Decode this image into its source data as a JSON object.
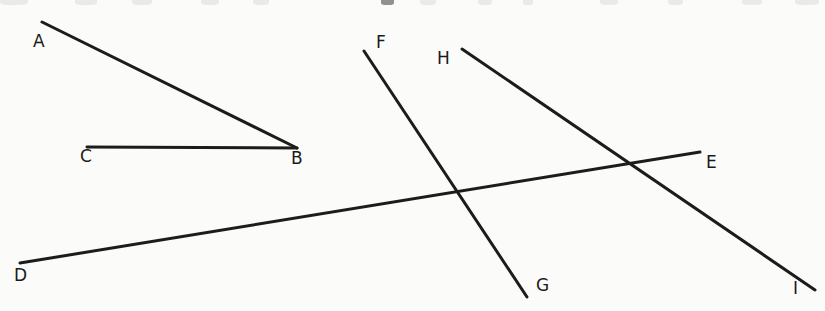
{
  "figure": {
    "width": 825,
    "height": 311,
    "background_color": "#fbfbf9",
    "stroke_color": "#1c1c1c",
    "stroke_width": 3,
    "label_color": "#1a1a1a",
    "label_font_size": 17
  },
  "points": {
    "A": {
      "x": 42,
      "y": 22,
      "label": "A",
      "label_x": 33,
      "label_y": 33
    },
    "B": {
      "x": 297,
      "y": 148,
      "label": "B",
      "label_x": 291,
      "label_y": 150
    },
    "C": {
      "x": 87,
      "y": 147,
      "label": "C",
      "label_x": 80,
      "label_y": 148
    },
    "D": {
      "x": 20,
      "y": 263,
      "label": "D",
      "label_x": 14,
      "label_y": 267
    },
    "E": {
      "x": 700,
      "y": 152,
      "label": "E",
      "label_x": 706,
      "label_y": 154
    },
    "F": {
      "x": 364,
      "y": 51,
      "label": "F",
      "label_x": 376,
      "label_y": 34
    },
    "G": {
      "x": 527,
      "y": 297,
      "label": "G",
      "label_x": 536,
      "label_y": 277
    },
    "H": {
      "x": 462,
      "y": 49,
      "label": "H",
      "label_x": 437,
      "label_y": 50
    },
    "I": {
      "x": 815,
      "y": 290,
      "label": "I",
      "label_x": 793,
      "label_y": 280
    }
  },
  "segments": [
    {
      "name": "ray-BA",
      "from": "A",
      "to": "B",
      "x1": 42,
      "y1": 22,
      "x2": 297,
      "y2": 148
    },
    {
      "name": "ray-BC",
      "from": "C",
      "to": "B",
      "x1": 87,
      "y1": 147,
      "x2": 297,
      "y2": 148
    },
    {
      "name": "line-DE",
      "from": "D",
      "to": "E",
      "x1": 20,
      "y1": 263,
      "x2": 700,
      "y2": 152
    },
    {
      "name": "line-FG",
      "from": "F",
      "to": "G",
      "x1": 364,
      "y1": 51,
      "x2": 527,
      "y2": 297
    },
    {
      "name": "line-HI",
      "from": "H",
      "to": "I",
      "x1": 462,
      "y1": 49,
      "x2": 815,
      "y2": 290
    }
  ],
  "intersections": [
    {
      "name": "DE-x-FG",
      "x": 462,
      "y": 194
    },
    {
      "name": "DE-x-HI",
      "x": 630,
      "y": 163
    }
  ],
  "crop_artifacts": [
    {
      "x": 0,
      "width": 28,
      "opacity": "pale"
    },
    {
      "x": 75,
      "width": 22,
      "opacity": "pale"
    },
    {
      "x": 132,
      "width": 20,
      "opacity": "pale"
    },
    {
      "x": 201,
      "width": 18,
      "opacity": "pale"
    },
    {
      "x": 253,
      "width": 16,
      "opacity": "pale"
    },
    {
      "x": 381,
      "width": 13,
      "opacity": "dark"
    },
    {
      "x": 420,
      "width": 16,
      "opacity": "pale"
    },
    {
      "x": 478,
      "width": 14,
      "opacity": "pale"
    },
    {
      "x": 523,
      "width": 10,
      "opacity": "pale"
    },
    {
      "x": 600,
      "width": 18,
      "opacity": "pale"
    },
    {
      "x": 668,
      "width": 15,
      "opacity": "pale"
    },
    {
      "x": 742,
      "width": 20,
      "opacity": "pale"
    },
    {
      "x": 795,
      "width": 24,
      "opacity": "pale"
    }
  ]
}
